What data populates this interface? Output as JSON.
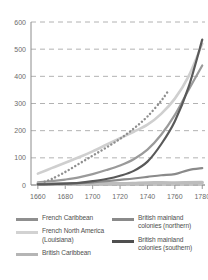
{
  "chart_data": {
    "type": "line",
    "title": "",
    "subtitle": "",
    "xlabel": "",
    "ylabel": "",
    "xlim": [
      1655,
      1782
    ],
    "ylim": [
      0,
      600
    ],
    "grid": true,
    "legend_position": "bottom",
    "x_ticks": [
      "1660",
      "1680",
      "1700",
      "1720",
      "1740",
      "1760",
      "1780"
    ],
    "y_ticks": [
      "0",
      "100",
      "200",
      "300",
      "400",
      "500",
      "600"
    ],
    "series": [
      {
        "name": "French Caribbean",
        "color": "#9a9a9a",
        "style": "solid",
        "width": 2.2,
        "x": [
          1660,
          1670,
          1680,
          1690,
          1700,
          1710,
          1720,
          1730,
          1740,
          1750,
          1760,
          1770,
          1780
        ],
        "values": [
          10,
          14,
          20,
          28,
          40,
          55,
          72,
          95,
          130,
          185,
          258,
          350,
          440
        ]
      },
      {
        "name": "French North America (Louisiana)",
        "color": "#cfcfcf",
        "style": "solid",
        "width": 2.6,
        "x": [
          1660,
          1670,
          1680,
          1690,
          1700,
          1710,
          1720,
          1730,
          1740,
          1750,
          1760,
          1770,
          1780
        ],
        "values": [
          42,
          62,
          82,
          102,
          124,
          148,
          172,
          196,
          222,
          262,
          318,
          400,
          520
        ]
      },
      {
        "name": "British Caribbean",
        "color": "#bdbdbd",
        "style": "solid",
        "width": 3.4,
        "x": [
          1660,
          1680,
          1700,
          1720,
          1730,
          1740,
          1760,
          1780
        ],
        "values": [
          4,
          4,
          5,
          5,
          6,
          8,
          8,
          9
        ]
      },
      {
        "name": "British mainland colonies (northern)",
        "color": "#8a8a8a",
        "style": "solid",
        "width": 2.2,
        "x": [
          1660,
          1670,
          1680,
          1690,
          1700,
          1710,
          1720,
          1730,
          1740,
          1750,
          1760,
          1770,
          1780
        ],
        "values": [
          3,
          4,
          5,
          7,
          10,
          14,
          19,
          24,
          30,
          36,
          40,
          55,
          62
        ]
      },
      {
        "name": "British mainland colonies (southern)",
        "color": "#595959",
        "style": "solid",
        "width": 2.2,
        "x": [
          1660,
          1670,
          1680,
          1690,
          1700,
          1710,
          1720,
          1730,
          1740,
          1750,
          1760,
          1770,
          1780
        ],
        "values": [
          2,
          3,
          5,
          8,
          14,
          22,
          34,
          52,
          86,
          150,
          235,
          360,
          535
        ]
      },
      {
        "name": "French Caribbean (dotted overlay)",
        "color": "#8f8f8f",
        "style": "dotted",
        "width": 2.4,
        "x": [
          1665,
          1670,
          1680,
          1690,
          1700,
          1710,
          1720,
          1730,
          1740,
          1750,
          1755
        ],
        "values": [
          12,
          22,
          48,
          78,
          108,
          138,
          170,
          208,
          252,
          310,
          345
        ]
      }
    ]
  },
  "legend": {
    "left_column": [
      {
        "label": "French Caribbean",
        "color": "#8f8f8f"
      },
      {
        "label": "French North America (Louisiana)",
        "color": "#d2d2d2"
      },
      {
        "label": "British Caribbean",
        "color": "#b5b5b5"
      }
    ],
    "right_column": [
      {
        "label": "British mainland colonies (northern)",
        "color": "#8a8a8a"
      },
      {
        "label": "British mainland colonies (southern)",
        "color": "#4f4f4f"
      }
    ]
  }
}
